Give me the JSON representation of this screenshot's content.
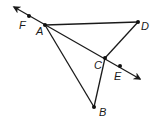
{
  "diagram": {
    "type": "geometry",
    "colors": {
      "stroke": "#1a1a1a",
      "point": "#111111",
      "background": "#ffffff"
    },
    "points": {
      "A": {
        "label": "A",
        "x": 45,
        "y": 25,
        "lx": 36,
        "ly": 35
      },
      "B": {
        "label": "B",
        "x": 94,
        "y": 107,
        "lx": 99,
        "ly": 116
      },
      "C": {
        "label": "C",
        "x": 105,
        "y": 58,
        "lx": 94,
        "ly": 69
      },
      "D": {
        "label": "D",
        "x": 138,
        "y": 22,
        "lx": 141,
        "ly": 30
      },
      "E": {
        "label": "E",
        "x": 120,
        "y": 66,
        "lx": 114,
        "ly": 80
      },
      "F": {
        "label": "F",
        "x": 29,
        "y": 16,
        "lx": 19,
        "ly": 29
      }
    },
    "line": {
      "name": "line FE",
      "from_arrow": {
        "x": 14,
        "y": 7
      },
      "to_arrow": {
        "x": 140,
        "y": 79
      },
      "through": [
        "F",
        "A",
        "C",
        "E"
      ]
    },
    "segments": [
      {
        "name": "AD",
        "from": "A",
        "to": "D"
      },
      {
        "name": "DC",
        "from": "D",
        "to": "C"
      },
      {
        "name": "AB",
        "from": "A",
        "to": "B"
      },
      {
        "name": "CB",
        "from": "C",
        "to": "B"
      }
    ]
  }
}
